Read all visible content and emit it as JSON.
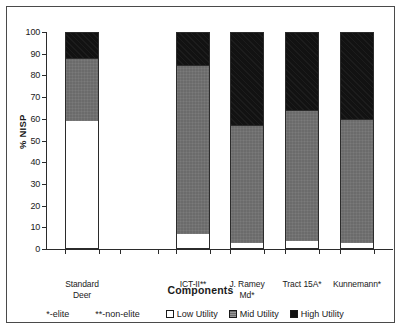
{
  "chart_data": {
    "type": "bar",
    "stacked": true,
    "title": "",
    "xlabel": "Components",
    "ylabel": "% NISP",
    "ylim": [
      0,
      100
    ],
    "yticks": [
      0,
      10,
      20,
      30,
      40,
      50,
      60,
      70,
      80,
      90,
      100
    ],
    "grid": false,
    "legend_position": "bottom",
    "categories": [
      "Standard\nDeer",
      "",
      "ICT-II**",
      "J. Ramey\nMd*",
      "Tract 15A*",
      "Kunnemann*"
    ],
    "series": [
      {
        "name": "Low Utility",
        "color": "#ffffff",
        "values": [
          59,
          null,
          7,
          3,
          3.5,
          3
        ]
      },
      {
        "name": "Mid Utility",
        "color": "#6b6b6b",
        "values": [
          29,
          null,
          78,
          54,
          60.5,
          57
        ]
      },
      {
        "name": "High Utility",
        "color": "#121212",
        "values": [
          12,
          null,
          15,
          43,
          36,
          40
        ]
      }
    ],
    "annotations": [
      "*-elite",
      "**-non-elite"
    ]
  },
  "axes": {
    "y_title": "% NISP",
    "x_title": "Components",
    "y_tick_labels": [
      "100",
      "90",
      "80",
      "70",
      "60",
      "50",
      "40",
      "30",
      "20",
      "10",
      "0"
    ]
  },
  "bars": [
    {
      "label": "Standard\nDeer",
      "low": 59,
      "mid": 29,
      "high": 12
    },
    {
      "label": "ICT-II**",
      "low": 7,
      "mid": 78,
      "high": 15
    },
    {
      "label": "J. Ramey\nMd*",
      "low": 3,
      "mid": 54,
      "high": 43
    },
    {
      "label": "Tract 15A*",
      "low": 3.5,
      "mid": 60.5,
      "high": 36
    },
    {
      "label": "Kunnemann*",
      "low": 3,
      "mid": 57,
      "high": 40
    }
  ],
  "notes": [
    {
      "text": "*-elite"
    },
    {
      "text": "**-non-elite"
    }
  ],
  "legend": [
    {
      "label": "Low Utility",
      "color": "#ffffff"
    },
    {
      "label": "Mid Utility",
      "color": "#6b6b6b"
    },
    {
      "label": "High Utility",
      "color": "#121212"
    }
  ]
}
